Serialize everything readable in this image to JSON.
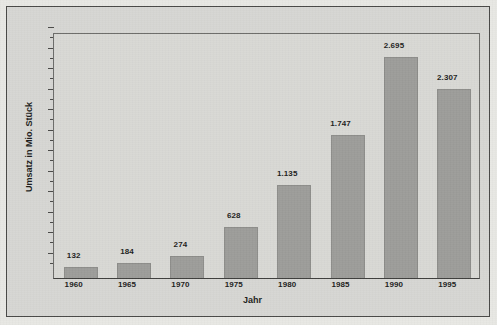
{
  "chart_data": {
    "type": "bar",
    "title": "",
    "subtitle": "",
    "xlabel": "Jahr",
    "ylabel": "Umsatz in Mio. Stück",
    "categories": [
      "1960",
      "1965",
      "1970",
      "1975",
      "1980",
      "1985",
      "1990",
      "1995"
    ],
    "values": [
      132,
      184,
      274,
      628,
      1135,
      1747,
      2695,
      2307
    ],
    "value_labels": [
      "132",
      "184",
      "274",
      "628",
      "1.135",
      "1.747",
      "2.695",
      "2.307"
    ],
    "ylim": [
      0,
      3000
    ],
    "xlim_categories": 8,
    "grid": false,
    "legend": null,
    "legend_position": "none",
    "y_axis_tick_labels": [],
    "y_axis_has_numeric_labels": false,
    "bar_color": "#9d9d9a",
    "plot_background": "#d9d9d5",
    "figure_background": "#d7d7d3",
    "axis_color": "#4a4a48",
    "text_color": "#1d1d1c"
  },
  "figure": {
    "outer_border_present": true
  }
}
